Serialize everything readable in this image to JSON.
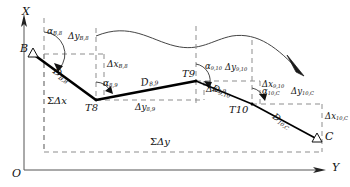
{
  "figure": {
    "type": "surveying-traverse-diagram",
    "axes": {
      "x_label": "X",
      "y_label": "Y",
      "origin_label": "O"
    },
    "stations": [
      {
        "id": "B",
        "label": "B",
        "marker": "triangle",
        "x": 33,
        "y": 54
      },
      {
        "id": "T8",
        "label": "T8",
        "marker": "vertex",
        "x": 96,
        "y": 100
      },
      {
        "id": "T9",
        "label": "T9",
        "marker": "vertex",
        "x": 196,
        "y": 81
      },
      {
        "id": "T10",
        "label": "T10",
        "marker": "vertex",
        "x": 252,
        "y": 104
      },
      {
        "id": "C",
        "label": "C",
        "marker": "triangle",
        "x": 317,
        "y": 139
      }
    ],
    "legs": [
      {
        "from": "B",
        "to": "T8",
        "distance_label": "D",
        "distance_sub": "B,8",
        "azimuth_label": "α",
        "azimuth_sub": "B,8",
        "delta_y_label": "Δy",
        "delta_y_sub": "B,8",
        "delta_x_label": "Δx",
        "delta_x_sub": "B,8"
      },
      {
        "from": "T8",
        "to": "T9",
        "distance_label": "D",
        "distance_sub": "8,9",
        "azimuth_label": "α",
        "azimuth_sub": "8,9",
        "delta_y_label": "Δy",
        "delta_y_sub": "8,9",
        "delta_x_label": "Δx",
        "delta_x_sub": "8,9"
      },
      {
        "from": "T9",
        "to": "T10",
        "distance_label": "D",
        "distance_sub": "9,10",
        "azimuth_label": "α",
        "azimuth_sub": "9,10",
        "delta_y_label": "Δy",
        "delta_y_sub": "9,10",
        "delta_x_label": "Δx",
        "delta_x_sub": "9,10"
      },
      {
        "from": "T10",
        "to": "C",
        "distance_label": "D",
        "distance_sub": "10,C",
        "azimuth_label": "α",
        "azimuth_sub": "10,C",
        "delta_y_label": "Δy",
        "delta_y_sub": "10,C",
        "delta_x_label": "Δx",
        "delta_x_sub": "10,C"
      }
    ],
    "totals": {
      "sum_delta_x": {
        "sigma": "Σ",
        "text": "Δx"
      },
      "sum_delta_y": {
        "sigma": "Σ",
        "text": "Δy"
      }
    },
    "feature_curve": {
      "name": "river-curve",
      "has_direction_arrow": true
    },
    "colors": {
      "ink": "#111111",
      "traverse": "#000000",
      "dashed": "#8a8a8a",
      "axis": "#555555",
      "curve": "#444444"
    }
  }
}
